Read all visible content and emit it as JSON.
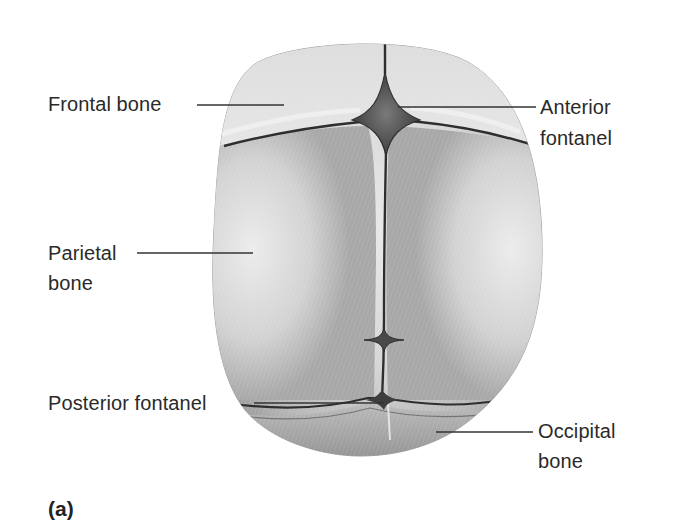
{
  "figure": {
    "panel_label": "(a)",
    "labels": {
      "frontal_bone": "Frontal bone",
      "anterior_fontanel_line1": "Anterior",
      "anterior_fontanel_line2": "fontanel",
      "parietal_bone_line1": "Parietal",
      "parietal_bone_line2": "bone",
      "posterior_fontanel": "Posterior fontanel",
      "occipital_bone_line1": "Occipital",
      "occipital_bone_line2": "bone"
    },
    "colors": {
      "background": "#ffffff",
      "bone_light": "#e4e4e4",
      "bone_mid": "#c9c9c9",
      "bone_dark": "#9a9a9a",
      "suture": "#2e2e2e",
      "fontanel": "#5a5a5a",
      "leader_line": "#333333",
      "text": "#2a2a2a"
    }
  }
}
